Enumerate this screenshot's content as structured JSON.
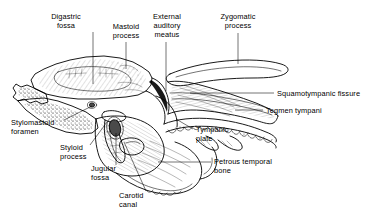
{
  "figure": {
    "background_color": "#ffffff",
    "ink_color": "#000000",
    "view_width": 385,
    "view_height": 224
  },
  "labels": [
    {
      "id": "digastric-fossa",
      "text": "Digastric\nfossa",
      "x": 66,
      "y": 12,
      "align": "center",
      "leader": "M 93 32 L 93 84"
    },
    {
      "id": "mastoid-process",
      "text": "Mastoid\nprocess",
      "x": 99,
      "y": 22,
      "align": "center",
      "leader": "M 126 42 L 126 69"
    },
    {
      "id": "external-auditory-meatus",
      "text": "External\nauditory\nmeatus",
      "x": 144,
      "y": 12,
      "align": "center",
      "leader": "M 166 42 L 166 91"
    },
    {
      "id": "zygomatic-process",
      "text": "Zygomatic\nprocess",
      "x": 212,
      "y": 12,
      "align": "center",
      "leader": "M 238 33 L 238 64"
    },
    {
      "id": "squamotympanic-fissure",
      "text": "Squamotympanic fissure",
      "x": 277,
      "y": 89,
      "align": "left",
      "leader": "M 274 93 L 190 93"
    },
    {
      "id": "tegmen-tympani",
      "text": "Tegmen tympani",
      "x": 266,
      "y": 106,
      "align": "left",
      "leader": "M 263 110 L 235 110"
    },
    {
      "id": "tympanic-plate",
      "text": "Tympanic\nplate",
      "x": 195,
      "y": 125,
      "align": "left",
      "leader": "M 193 129 L 176 119"
    },
    {
      "id": "petrous-temporal-bone",
      "text": "Petrous temporal\nbone",
      "x": 214,
      "y": 158,
      "align": "left",
      "leader": "M 211 162 L 158 162"
    },
    {
      "id": "stylomastoid-foramen",
      "text": "Stylomastoid\nforamen",
      "x": 11,
      "y": 118,
      "align": "left",
      "leader": "M 64 120 L 92 106"
    },
    {
      "id": "styloid-process",
      "text": "Styloid\nprocess",
      "x": 60,
      "y": 143,
      "align": "left",
      "leader": "M 90 145 L 107 122"
    },
    {
      "id": "jugular-fossa",
      "text": "Jugular\nfossa",
      "x": 91,
      "y": 164,
      "align": "left",
      "leader": "M 116 165 L 116 133"
    },
    {
      "id": "carotid-canal",
      "text": "Carotid\ncanal",
      "x": 119,
      "y": 192,
      "align": "left",
      "leader": "M 146 191 L 124 142"
    }
  ]
}
